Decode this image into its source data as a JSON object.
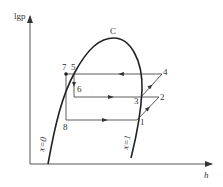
{
  "diagram": {
    "type": "lg p - h refrigeration cycle diagram",
    "y_axis_label": "lgp",
    "x_axis_label": "h",
    "critical_point_label": "C",
    "saturated_liquid_line_label": "x=0",
    "saturated_vapor_line_label": "x=1",
    "points": [
      {
        "id": "1",
        "label": "1",
        "x": 137,
        "y": 120
      },
      {
        "id": "2",
        "label": "2",
        "x": 159,
        "y": 97
      },
      {
        "id": "3",
        "label": "3",
        "x": 141,
        "y": 97
      },
      {
        "id": "4",
        "label": "4",
        "x": 162,
        "y": 74
      },
      {
        "id": "5",
        "label": "5",
        "x": 74,
        "y": 74
      },
      {
        "id": "6",
        "label": "6",
        "x": 74,
        "y": 97
      },
      {
        "id": "7",
        "label": "7",
        "x": 66,
        "y": 74
      },
      {
        "id": "8",
        "label": "8",
        "x": 66,
        "y": 120
      }
    ],
    "colors": {
      "line": "#222222",
      "axis": "#555555",
      "text": "#333333"
    }
  }
}
